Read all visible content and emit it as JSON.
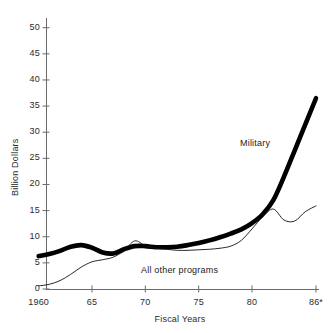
{
  "chart_data": {
    "type": "line",
    "title": "",
    "subtitle": "",
    "xlabel": "Fiscal Years",
    "ylabel": "Billion Dollars",
    "xlim": [
      1959.2,
      1986.2
    ],
    "ylim": [
      0,
      52
    ],
    "grid": false,
    "legend_position": "inline-annotations",
    "x_tick_values": [
      1960,
      1965,
      1970,
      1975,
      1980,
      1986
    ],
    "x_tick_labels": [
      "1960",
      "65",
      "70",
      "75",
      "80",
      "86*"
    ],
    "y_tick_values": [
      0,
      5,
      10,
      15,
      20,
      25,
      30,
      35,
      40,
      45,
      50
    ],
    "y_tick_labels": [
      "0",
      "5",
      "10",
      "15",
      "20",
      "25",
      "30",
      "35",
      "40",
      "45",
      "50"
    ],
    "x": [
      1960,
      1961,
      1962,
      1963,
      1964,
      1965,
      1966,
      1967,
      1968,
      1969,
      1970,
      1971,
      1972,
      1973,
      1974,
      1975,
      1976,
      1977,
      1978,
      1979,
      1980,
      1981,
      1982,
      1983,
      1984,
      1985,
      1986
    ],
    "series": [
      {
        "name": "Military",
        "label": "Military",
        "style": "thick-black",
        "color": "#000000",
        "linewidth": 4.6,
        "values": [
          6.3,
          6.7,
          7.3,
          8.1,
          8.4,
          7.9,
          7.0,
          6.8,
          7.6,
          8.2,
          8.2,
          8.0,
          8.0,
          8.1,
          8.4,
          8.8,
          9.3,
          9.9,
          10.6,
          11.4,
          12.6,
          14.3,
          17.0,
          21.5,
          26.5,
          31.5,
          36.5
        ]
      },
      {
        "name": "All other programs",
        "label": "All other programs",
        "style": "thin-black",
        "color": "#111111",
        "linewidth": 0.9,
        "values": [
          0.6,
          0.9,
          1.6,
          2.8,
          4.2,
          5.2,
          5.6,
          6.1,
          7.3,
          9.2,
          8.3,
          7.8,
          7.6,
          7.4,
          7.4,
          7.5,
          7.6,
          7.8,
          8.2,
          9.3,
          11.5,
          13.8,
          15.3,
          13.2,
          13.0,
          14.8,
          15.9
        ]
      }
    ],
    "annotations": [
      {
        "name": "military-label",
        "text": "Military",
        "x_px": 240,
        "y_px": 138
      },
      {
        "name": "all-other-programs-label",
        "text": "All other programs",
        "x_px": 141,
        "y_px": 265
      }
    ]
  },
  "axes": {
    "y_title": "Billion Dollars",
    "x_title": "Fiscal Years"
  }
}
